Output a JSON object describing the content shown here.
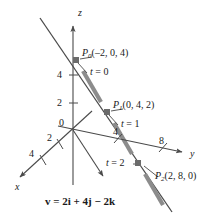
{
  "figure": {
    "type": "3d-coordinate-line-diagram",
    "background_color": "#ffffff",
    "line_color": "#4a4a4a",
    "highlight_color": "#8c8c8c",
    "text_color": "#1a1a1a"
  },
  "axes": {
    "z": {
      "label": "z",
      "ticks": [
        "4",
        "2"
      ]
    },
    "y": {
      "label": "y",
      "ticks": [
        "4",
        "8"
      ]
    },
    "x": {
      "label": "x",
      "ticks": [
        "2",
        "4"
      ]
    },
    "origin_label": "0"
  },
  "points": [
    {
      "name": "P",
      "subscript": "0",
      "coords": "(–2, 0, 4)",
      "parameter": "t = 0",
      "param_var": "t",
      "param_value": "= 0"
    },
    {
      "name": "P",
      "subscript": "1",
      "coords": "(0, 4, 2)",
      "parameter": "t = 1",
      "param_var": "t",
      "param_value": "= 1"
    },
    {
      "name": "P",
      "subscript": "2",
      "coords": "(2, 8, 0)",
      "parameter": "t = 2",
      "param_var": "t",
      "param_value": "= 2"
    }
  ],
  "equation": {
    "vector_symbol": "v",
    "text": "v = 2i + 4j − 2k",
    "rhs": "= 2i + 4j − 2k"
  }
}
